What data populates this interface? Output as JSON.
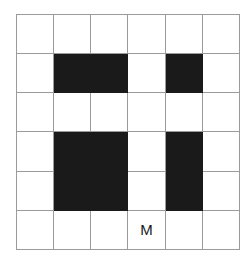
{
  "figure": {
    "name": "grid-occupancy-diagram",
    "rows": 6,
    "columns": 6,
    "colors": {
      "background": "#ffffff",
      "gridline": "#9b9b9b",
      "filled_cell": "#1a1a1a",
      "empty_cell": "#ffffff",
      "label_text": "#1a1a1a"
    },
    "cells": [
      [
        {
          "filled": false,
          "label": ""
        },
        {
          "filled": false,
          "label": ""
        },
        {
          "filled": false,
          "label": ""
        },
        {
          "filled": false,
          "label": ""
        },
        {
          "filled": false,
          "label": ""
        },
        {
          "filled": false,
          "label": ""
        }
      ],
      [
        {
          "filled": false,
          "label": ""
        },
        {
          "filled": true,
          "label": ""
        },
        {
          "filled": true,
          "label": ""
        },
        {
          "filled": false,
          "label": ""
        },
        {
          "filled": true,
          "label": ""
        },
        {
          "filled": false,
          "label": ""
        }
      ],
      [
        {
          "filled": false,
          "label": ""
        },
        {
          "filled": false,
          "label": ""
        },
        {
          "filled": false,
          "label": ""
        },
        {
          "filled": false,
          "label": ""
        },
        {
          "filled": false,
          "label": ""
        },
        {
          "filled": false,
          "label": ""
        }
      ],
      [
        {
          "filled": false,
          "label": ""
        },
        {
          "filled": true,
          "label": ""
        },
        {
          "filled": true,
          "label": ""
        },
        {
          "filled": false,
          "label": ""
        },
        {
          "filled": true,
          "label": ""
        },
        {
          "filled": false,
          "label": ""
        }
      ],
      [
        {
          "filled": false,
          "label": ""
        },
        {
          "filled": true,
          "label": ""
        },
        {
          "filled": true,
          "label": ""
        },
        {
          "filled": false,
          "label": ""
        },
        {
          "filled": true,
          "label": ""
        },
        {
          "filled": false,
          "label": ""
        }
      ],
      [
        {
          "filled": false,
          "label": ""
        },
        {
          "filled": false,
          "label": ""
        },
        {
          "filled": false,
          "label": ""
        },
        {
          "filled": false,
          "label": "M"
        },
        {
          "filled": false,
          "label": ""
        },
        {
          "filled": false,
          "label": ""
        }
      ]
    ]
  }
}
